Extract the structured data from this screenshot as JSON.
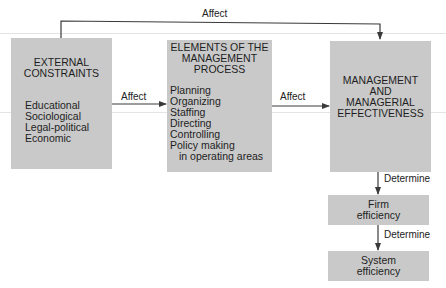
{
  "diagram": {
    "colors": {
      "box_fill": "#c9c9c9",
      "line": "#3a3a3a",
      "text": "#1e1e1e"
    },
    "top_arrow": {
      "label": "Affect"
    },
    "external": {
      "title_lines": [
        "EXTERNAL",
        "CONSTRAINTS"
      ],
      "items": [
        "Educational",
        "Sociological",
        "Legal-political",
        "Economic"
      ]
    },
    "arrow_external_to_process": {
      "label": "Affect"
    },
    "process": {
      "title_lines": [
        "ELEMENTS OF THE",
        "MANAGEMENT",
        "PROCESS"
      ],
      "items": [
        "Planning",
        "Organizing",
        "Staffing",
        "Directing",
        "Controlling",
        "Policy making",
        "in operating areas"
      ]
    },
    "arrow_process_to_effectiveness": {
      "label": "Affect"
    },
    "effectiveness": {
      "title_lines": [
        "MANAGEMENT",
        "AND",
        "MANAGERIAL",
        "EFFECTIVENESS"
      ]
    },
    "arrow_effectiveness_to_firm": {
      "label": "Determine"
    },
    "firm": {
      "lines": [
        "Firm",
        "efficiency"
      ]
    },
    "arrow_firm_to_system": {
      "label": "Determine"
    },
    "system": {
      "lines": [
        "System",
        "efficiency"
      ]
    }
  }
}
